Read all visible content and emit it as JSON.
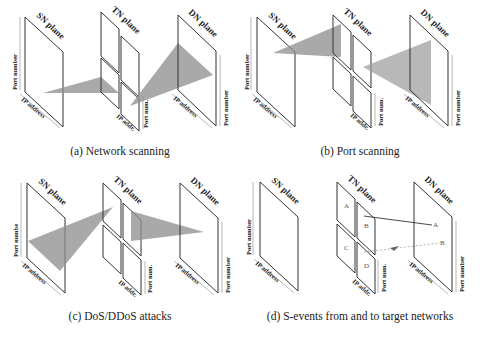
{
  "figure": {
    "panels": [
      {
        "id": "a",
        "caption": "(a) Network scanning",
        "planes": {
          "sn": "SN plane",
          "tn": "TN plane",
          "dn": "DN plane"
        },
        "axes": {
          "sn_vertical": "Port number",
          "sn_horizontal": "IP address",
          "tn_vertical": "Port num.",
          "tn_horizontal": "IP addr.",
          "dn_vertical": "Port number",
          "dn_horizontal": "IP address"
        },
        "pattern": "one source port range converging to one TN point then fanning across many DN IP addresses"
      },
      {
        "id": "b",
        "caption": "(b) Port scanning",
        "planes": {
          "sn": "SN plane",
          "tn": "TN plane",
          "dn": "DN plane"
        },
        "axes": {
          "sn_vertical": "Port number",
          "sn_horizontal": "IP address",
          "tn_vertical": "Port num.",
          "tn_horizontal": "IP addr.",
          "dn_vertical": "Port number",
          "dn_horizontal": "IP address"
        },
        "pattern": "single source fanning across many destination ports on one DN IP address"
      },
      {
        "id": "c",
        "caption": "(c) DoS/DDoS attacks",
        "planes": {
          "sn": "SN plane",
          "tn": "TN plane",
          "dn": "DN plane"
        },
        "axes": {
          "sn_vertical": "Port numbe",
          "sn_horizontal": "IP address",
          "tn_vertical": "Port num.",
          "tn_horizontal": "IP addr.",
          "dn_vertical": "Port number",
          "dn_horizontal": "IP address"
        },
        "pattern": "many sources converging to a single destination"
      },
      {
        "id": "d",
        "caption": "(d) S-events from and to target networks",
        "planes": {
          "sn": "SN plane",
          "tn": "TN plane",
          "dn": "DN plane"
        },
        "axes": {
          "sn_vertical": "Port number",
          "sn_horizontal": "IP address",
          "tn_vertical": "Port num.",
          "tn_horizontal": "IP addr.",
          "dn_vertical": "Port number",
          "dn_horizontal": "IP address"
        },
        "tn_quadrants": [
          "A",
          "B",
          "C",
          "D"
        ],
        "dn_points": [
          "A",
          "B"
        ]
      }
    ]
  }
}
